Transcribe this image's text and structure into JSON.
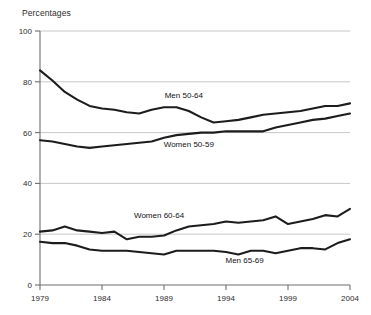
{
  "chart_data": {
    "type": "line",
    "title": "",
    "ylabel": "Percentages",
    "xlabel": "",
    "ylim": [
      0,
      100
    ],
    "xlim": [
      1979,
      2004
    ],
    "grid": true,
    "legend_position": "inline-annotations",
    "y_ticks": [
      0,
      20,
      40,
      60,
      80,
      100
    ],
    "y_tick_labels": [
      "0",
      "20",
      "40",
      "60",
      "80",
      "100"
    ],
    "x_ticks": [
      1979,
      1984,
      1989,
      1994,
      1999,
      2004
    ],
    "x_tick_labels": [
      "1979",
      "1984",
      "1989",
      "1994",
      "1999",
      "2004"
    ],
    "x": [
      1979,
      1980,
      1981,
      1982,
      1983,
      1984,
      1985,
      1986,
      1987,
      1988,
      1989,
      1990,
      1991,
      1992,
      1993,
      1994,
      1995,
      1996,
      1997,
      1998,
      1999,
      2000,
      2001,
      2002,
      2003,
      2004
    ],
    "series": [
      {
        "name": "Men 50-64",
        "label": "Men 50-64",
        "label_x": 1990.6,
        "label_y": 73.5,
        "values": [
          84.5,
          80.5,
          76.0,
          73.0,
          70.5,
          69.5,
          69.0,
          68.0,
          67.5,
          69.0,
          70.0,
          70.0,
          68.5,
          66.0,
          64.0,
          64.5,
          65.0,
          66.0,
          67.0,
          67.5,
          68.0,
          68.5,
          69.5,
          70.5,
          70.5,
          71.5
        ]
      },
      {
        "name": "Women 50-59",
        "label": "Women 50-59",
        "label_x": 1991.0,
        "label_y": 54.5,
        "values": [
          57.0,
          56.5,
          55.5,
          54.5,
          54.0,
          54.5,
          55.0,
          55.5,
          56.0,
          56.5,
          58.0,
          59.0,
          59.5,
          60.0,
          60.0,
          60.5,
          60.5,
          60.5,
          60.5,
          62.0,
          63.0,
          64.0,
          65.0,
          65.5,
          66.5,
          67.5
        ]
      },
      {
        "name": "Women 60-64",
        "label": "Women 60-64",
        "label_x": 1988.6,
        "label_y": 26.5,
        "values": [
          21.0,
          21.5,
          23.0,
          21.5,
          21.0,
          20.5,
          21.0,
          18.0,
          19.0,
          19.0,
          19.5,
          21.5,
          23.0,
          23.5,
          24.0,
          25.0,
          24.5,
          25.0,
          25.5,
          27.0,
          24.0,
          25.0,
          26.0,
          27.5,
          27.0,
          30.0
        ]
      },
      {
        "name": "Men 65-69",
        "label": "Men 65-69",
        "label_x": 1995.5,
        "label_y": 8.5,
        "values": [
          17.0,
          16.5,
          16.5,
          15.5,
          14.0,
          13.5,
          13.5,
          13.5,
          13.0,
          12.5,
          12.0,
          13.5,
          13.5,
          13.5,
          13.5,
          13.0,
          12.0,
          13.5,
          13.5,
          12.5,
          13.5,
          14.5,
          14.5,
          14.0,
          16.5,
          18.0
        ]
      }
    ]
  }
}
